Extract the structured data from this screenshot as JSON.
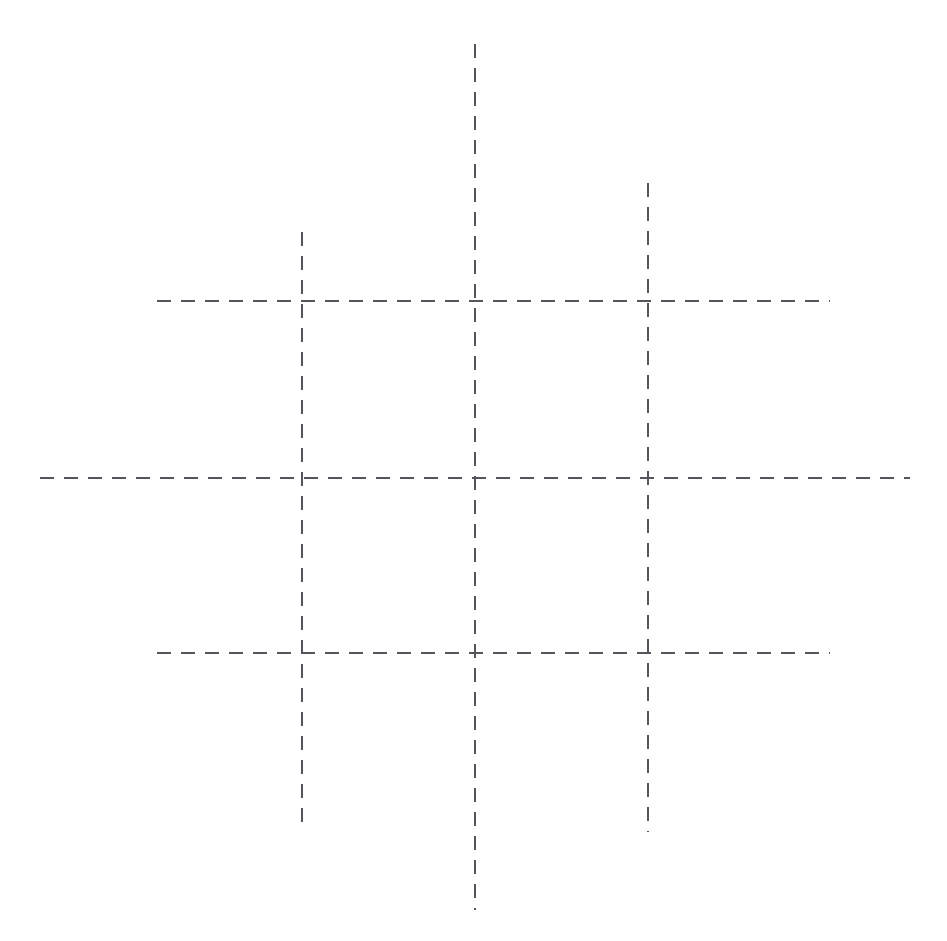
{
  "figure": {
    "title": "Dashed crosshair grid",
    "background_color": "#ffffff",
    "width": 947,
    "height": 941
  },
  "style": {
    "line_color": "#54545c",
    "line_width": 2,
    "dash_length": 14,
    "gap_length": 10,
    "dash_array": "14 10",
    "line_cap": "butt"
  },
  "chart_data": {
    "type": "line",
    "title": "Dashed crosshair grid",
    "subtitle": "",
    "xlabel": "",
    "ylabel": "",
    "grid": true,
    "legend": "none",
    "xlim": [
      0,
      947
    ],
    "ylim": [
      0,
      941
    ],
    "categories": [],
    "values": [],
    "annotations": [],
    "series": [
      {
        "name": "vertical-line-left",
        "orientation": "vertical",
        "position": 302,
        "start": 232,
        "end": 832,
        "length": 600
      },
      {
        "name": "vertical-line-center",
        "orientation": "vertical",
        "position": 475,
        "start": 44,
        "end": 910,
        "length": 866
      },
      {
        "name": "vertical-line-right",
        "orientation": "vertical",
        "position": 648,
        "start": 183,
        "end": 832,
        "length": 649
      },
      {
        "name": "horizontal-line-top",
        "orientation": "horizontal",
        "position": 301,
        "start": 157,
        "end": 830,
        "length": 673
      },
      {
        "name": "horizontal-line-middle",
        "orientation": "horizontal",
        "position": 478,
        "start": 40,
        "end": 910,
        "length": 870
      },
      {
        "name": "horizontal-line-bottom",
        "orientation": "horizontal",
        "position": 653,
        "start": 157,
        "end": 830,
        "length": 673
      }
    ],
    "intersections": [
      {
        "name": "intersection-top-left",
        "x": 302,
        "y": 301
      },
      {
        "name": "intersection-top-center",
        "x": 475,
        "y": 301
      },
      {
        "name": "intersection-top-right",
        "x": 648,
        "y": 301
      },
      {
        "name": "intersection-middle-left",
        "x": 302,
        "y": 478
      },
      {
        "name": "intersection-middle-center",
        "x": 475,
        "y": 478
      },
      {
        "name": "intersection-middle-right",
        "x": 648,
        "y": 478
      },
      {
        "name": "intersection-bottom-left",
        "x": 302,
        "y": 653
      },
      {
        "name": "intersection-bottom-center",
        "x": 475,
        "y": 653
      },
      {
        "name": "intersection-bottom-right",
        "x": 648,
        "y": 653
      }
    ]
  }
}
